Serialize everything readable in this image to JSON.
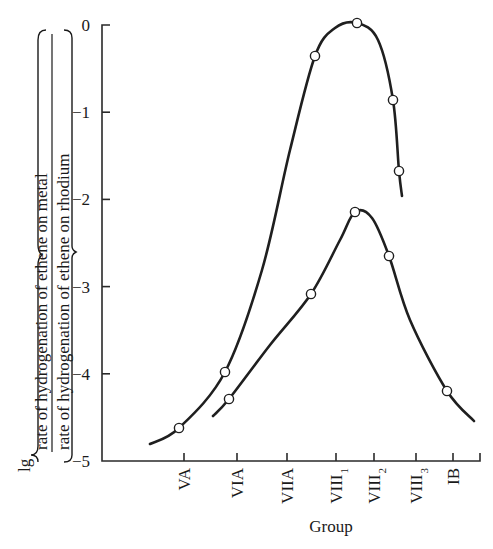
{
  "chart_data": {
    "type": "line",
    "title": "",
    "xlabel": "Group",
    "ylabel": {
      "prefix": "lg",
      "numerator": "rate of hydrogenation of ethene on metal",
      "denominator": "rate of hydrogenation of ethene on rhodium"
    },
    "categories": [
      "VA",
      "VIA",
      "VIIA",
      "VIII1",
      "VIII2",
      "VIII3",
      "IB"
    ],
    "category_display": [
      {
        "main": "VA",
        "sub": ""
      },
      {
        "main": "VIA",
        "sub": ""
      },
      {
        "main": "VIIA",
        "sub": ""
      },
      {
        "main": "VIII",
        "sub": "1"
      },
      {
        "main": "VIII",
        "sub": "2"
      },
      {
        "main": "VIII",
        "sub": "3"
      },
      {
        "main": "IB",
        "sub": ""
      }
    ],
    "y_ticks": [
      0,
      -1,
      -2,
      -3,
      -4,
      -5
    ],
    "y_tick_labels": [
      "0",
      "−1",
      "−2",
      "−3",
      "−4",
      "−5"
    ],
    "ylim": [
      -5,
      0
    ],
    "grid": false,
    "legend": null,
    "series": [
      {
        "name": "upper curve",
        "points": [
          {
            "x": 0.0,
            "y": -4.62
          },
          {
            "x": 0.85,
            "y": -3.95
          },
          {
            "x": 2.6,
            "y": -0.36
          },
          {
            "x": 3.55,
            "y": 0.0
          },
          {
            "x": 4.45,
            "y": -0.86
          },
          {
            "x": 4.6,
            "y": -1.67
          }
        ],
        "curve_path_values": [
          {
            "x": -0.6,
            "y": -4.8
          },
          {
            "x": 0.0,
            "y": -4.62
          },
          {
            "x": 0.85,
            "y": -3.95
          },
          {
            "x": 1.6,
            "y": -2.4
          },
          {
            "x": 2.6,
            "y": -0.36
          },
          {
            "x": 3.55,
            "y": 0.0
          },
          {
            "x": 4.45,
            "y": -0.86
          },
          {
            "x": 4.6,
            "y": -1.67
          },
          {
            "x": 4.68,
            "y": -1.95
          }
        ]
      },
      {
        "name": "lower curve",
        "points": [
          {
            "x": 0.85,
            "y": -4.27
          },
          {
            "x": 2.55,
            "y": -3.05
          },
          {
            "x": 3.5,
            "y": -2.13
          },
          {
            "x": 4.35,
            "y": -2.63
          },
          {
            "x": 6.0,
            "y": -4.18
          }
        ],
        "curve_path_values": [
          {
            "x": 0.55,
            "y": -4.48
          },
          {
            "x": 0.85,
            "y": -4.27
          },
          {
            "x": 2.55,
            "y": -3.05
          },
          {
            "x": 3.5,
            "y": -2.13
          },
          {
            "x": 4.35,
            "y": -2.63
          },
          {
            "x": 6.0,
            "y": -4.18
          },
          {
            "x": 6.5,
            "y": -4.54
          }
        ]
      }
    ]
  }
}
